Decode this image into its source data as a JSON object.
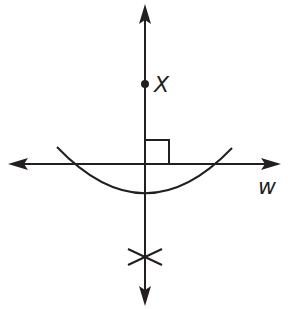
{
  "diagram": {
    "type": "geometric construction: perpendicular from point to line",
    "stroke_color": "#231f20",
    "background": "#ffffff",
    "point": {
      "label": "X"
    },
    "line": {
      "label": "w"
    },
    "elements": [
      "vertical line with arrows",
      "horizontal line w with arrows",
      "point X",
      "right angle marker",
      "compass arc",
      "intersecting arc marks"
    ]
  }
}
